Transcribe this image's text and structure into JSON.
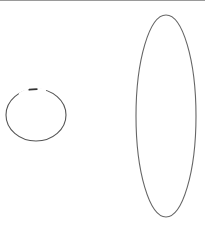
{
  "canvas": {
    "width": 205,
    "height": 231,
    "background": "#ffffff"
  },
  "top_rule": {
    "color": "#9a9a9a"
  },
  "shapes": [
    {
      "type": "ellipse",
      "name": "small-ellipse",
      "cx": 36,
      "cy": 115,
      "rx": 30,
      "ry": 26,
      "stroke": "#555555",
      "stroke_width": 1.1,
      "dash": "12 1.5 5 1.5 9 2",
      "gaps_at_top": true
    },
    {
      "type": "ellipse",
      "name": "tall-ellipse",
      "cx": 166,
      "cy": 116,
      "rx": 30,
      "ry": 101,
      "stroke": "#666666",
      "stroke_width": 1.1
    }
  ]
}
